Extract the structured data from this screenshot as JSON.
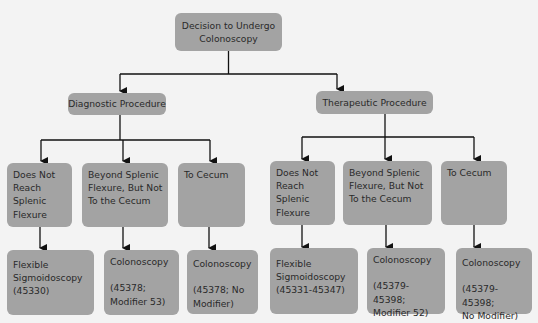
{
  "diagram": {
    "root": {
      "label": "Decision to Undergo\nColonoscopy"
    },
    "branches": [
      {
        "label": "Diagnostic Procedure",
        "children": [
          {
            "label": "Does Not\nReach\nSplenic\nFlexure",
            "outcome": "Flexible\nSigmoidoscopy\n(45330)"
          },
          {
            "label": "Beyond Splenic\nFlexure, But Not\nTo the Cecum",
            "outcome": "Colonoscopy\n\n(45378;\nModifier 53)"
          },
          {
            "label": "To Cecum",
            "outcome": "Colonoscopy\n\n(45378; No\nModifier)"
          }
        ]
      },
      {
        "label": "Therapeutic Procedure",
        "children": [
          {
            "label": "Does Not\nReach\nSplenic\nFlexure",
            "outcome": "Flexible\nSigmoidoscopy\n(45331-45347)"
          },
          {
            "label": "Beyond Splenic\nFlexure, But Not\nTo the Cecum",
            "outcome": "Colonoscopy\n\n(45379-45398;\nModifier 52)"
          },
          {
            "label": "To Cecum",
            "outcome": "Colonoscopy\n\n(45379-45398;\nNo Modifier)"
          }
        ]
      }
    ]
  },
  "colors": {
    "box": "#a3a3a3",
    "line": "#111111",
    "background": "#f3f3f3"
  }
}
